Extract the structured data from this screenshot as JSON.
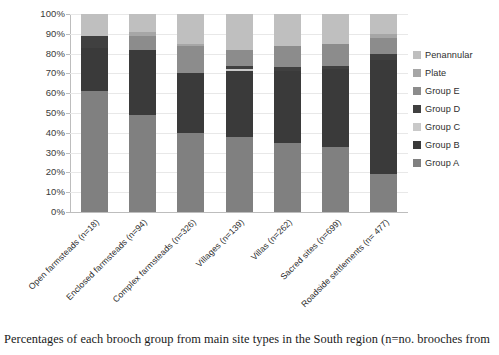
{
  "caption": "Percentages of each brooch group from main site types in the South region (n=no. brooches from",
  "legend": {
    "position": "right",
    "items": [
      {
        "label": "Penannular",
        "color": "#bfbfbf"
      },
      {
        "label": "Plate",
        "color": "#a6a6a6"
      },
      {
        "label": "Group E",
        "color": "#8c8c8c"
      },
      {
        "label": "Group D",
        "color": "#404040"
      },
      {
        "label": "Group C",
        "color": "#c9c9c9"
      },
      {
        "label": "Group B",
        "color": "#3a3a3a"
      },
      {
        "label": "Group A",
        "color": "#808080"
      }
    ]
  },
  "axes": {
    "y_ticks": [
      "0%",
      "10%",
      "20%",
      "30%",
      "40%",
      "50%",
      "60%",
      "70%",
      "80%",
      "90%",
      "100%"
    ],
    "y_min": 0,
    "y_max": 100
  },
  "chart_data": {
    "type": "bar",
    "subtype": "stacked-100-percent",
    "title": "",
    "xlabel": "",
    "ylabel": "",
    "ylim": [
      0,
      100
    ],
    "grid": true,
    "legend_position": "right",
    "categories": [
      "Open farmsteads (n=18)",
      "Enclosed farmsteads (n=94)",
      "Complex farmsteads (n=326)",
      "Villages (n=139)",
      "Villas (n=262)",
      "Sacred sites (n=699)",
      "Roadside settlements (n= 477)"
    ],
    "series": [
      {
        "name": "Group A",
        "color": "#808080",
        "values": [
          61,
          49,
          40,
          38,
          35,
          33,
          19
        ]
      },
      {
        "name": "Group B",
        "color": "#3a3a3a",
        "values": [
          22,
          33,
          30,
          33,
          36,
          39,
          58
        ]
      },
      {
        "name": "Group C",
        "color": "#c9c9c9",
        "values": [
          0,
          0,
          0,
          1,
          0,
          0,
          0
        ]
      },
      {
        "name": "Group D",
        "color": "#404040",
        "values": [
          6,
          0,
          0,
          2,
          2,
          2,
          3
        ]
      },
      {
        "name": "Group E",
        "color": "#8c8c8c",
        "values": [
          0,
          7,
          14,
          8,
          11,
          11,
          8
        ]
      },
      {
        "name": "Plate",
        "color": "#a6a6a6",
        "values": [
          0,
          2,
          1,
          0,
          0,
          0,
          2
        ]
      },
      {
        "name": "Penannular",
        "color": "#bfbfbf",
        "values": [
          11,
          9,
          15,
          18,
          16,
          15,
          10
        ]
      }
    ]
  }
}
